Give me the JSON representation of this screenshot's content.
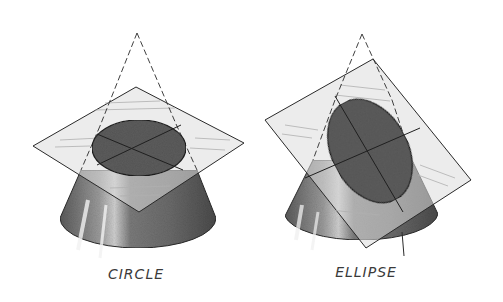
{
  "figures": [
    {
      "id": "circle",
      "label": "CIRCLE",
      "label_pos": [
        136,
        271
      ],
      "section_type": "circle",
      "apex": [
        137,
        33
      ],
      "plane": [
        [
          136,
          87
        ],
        [
          244,
          143
        ],
        [
          139,
          212
        ],
        [
          33,
          146
        ]
      ],
      "section": {
        "cx": 139,
        "cy": 148,
        "rx": 47,
        "ry": 28,
        "rotate": 0
      },
      "frustum": {
        "top_left": [
          81,
          170
        ],
        "top_right": [
          197,
          170
        ],
        "bottom_left": [
          60,
          218
        ],
        "bottom_right": [
          216,
          218
        ],
        "base": {
          "cx": 138,
          "cy": 232,
          "rx": 78,
          "ry": 30
        }
      }
    },
    {
      "id": "ellipse",
      "label": "ELLIPSE",
      "label_pos": [
        366,
        269
      ],
      "section_type": "ellipse",
      "apex": [
        362,
        34
      ],
      "plane": [
        [
          265,
          120
        ],
        [
          373,
          59
        ],
        [
          471,
          180
        ],
        [
          366,
          248
        ]
      ],
      "section": {
        "cx": 370,
        "cy": 151,
        "rx": 38,
        "ry": 55,
        "rotate": -28
      },
      "frustum": {
        "top_left": [
          313,
          160
        ],
        "top_right": [
          412,
          160
        ],
        "bottom_left": [
          285,
          216
        ],
        "bottom_right": [
          438,
          214
        ],
        "base": {
          "cx": 362,
          "cy": 230,
          "rx": 77,
          "ry": 28
        }
      }
    }
  ],
  "colors": {
    "background": "#ffffff",
    "cone_fill": "#6e6e6e",
    "section_fill": "#555555",
    "plane_fill": "#d8d8d8",
    "line": "#2a2a2a",
    "highlight": "#e8e8e8"
  }
}
